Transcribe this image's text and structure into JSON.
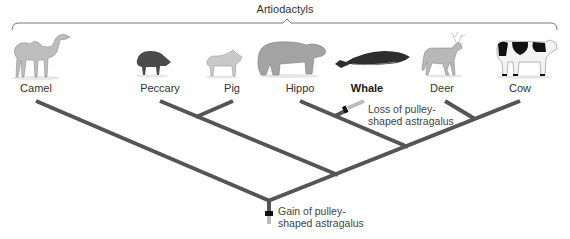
{
  "diagram": {
    "type": "phylogenetic-tree",
    "group_label": "Artiodactyls",
    "taxa": [
      {
        "name": "Camel",
        "x": 36,
        "highlight": false
      },
      {
        "name": "Peccary",
        "x": 160,
        "highlight": false
      },
      {
        "name": "Pig",
        "x": 232,
        "highlight": false
      },
      {
        "name": "Hippo",
        "x": 300,
        "highlight": false
      },
      {
        "name": "Whale",
        "x": 367,
        "highlight": true
      },
      {
        "name": "Deer",
        "x": 442,
        "highlight": false
      },
      {
        "name": "Cow",
        "x": 520,
        "highlight": false
      }
    ],
    "annotations": {
      "gain": {
        "line1": "Gain of pulley-",
        "line2": "shaped astragalus"
      },
      "loss": {
        "line1": "Loss of pulley-",
        "line2": "shaped astragalus"
      }
    },
    "colors": {
      "branch": "#555555",
      "lost_branch": "#bbbbbb",
      "marker": "#111111",
      "bracket": "#777777"
    },
    "tree_topology": "(Camel,((Peccary,Pig),((Hippo,Whale),(Deer,Cow))))"
  }
}
